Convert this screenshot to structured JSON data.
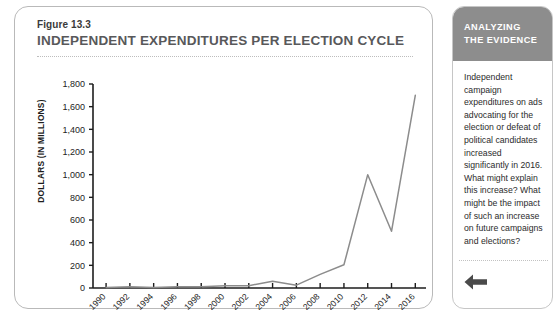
{
  "figure": {
    "number": "Figure 13.3",
    "title": "INDEPENDENT EXPENDITURES PER ELECTION CYCLE"
  },
  "sidebar": {
    "header_line1": "ANALYZING",
    "header_line2": "THE EVIDENCE",
    "body": "Independent campaign expenditures on ads advocating for the election or defeat of political candidates increased significantly in 2016. What might explain this increase? What might be the impact of such an increase on future campaigns and elections?",
    "back_arrow_icon": "arrow-left-icon"
  },
  "colors": {
    "panel_border": "#b9b9b9",
    "sidebar_header_bg": "#8d8d8d",
    "line": "#8c8c8c",
    "axis": "#1d1d1d",
    "title_text": "#58585a"
  },
  "chart_data": {
    "type": "line",
    "title": "INDEPENDENT EXPENDITURES PER ELECTION CYCLE",
    "xlabel": "",
    "ylabel": "DOLLARS (IN MILLIONS)",
    "x": [
      1990,
      1992,
      1994,
      1996,
      1998,
      2000,
      2002,
      2004,
      2006,
      2008,
      2010,
      2012,
      2014,
      2016
    ],
    "categories": [
      "1990",
      "1992",
      "1994",
      "1996",
      "1998",
      "2000",
      "2002",
      "2004",
      "2006",
      "2008",
      "2010",
      "2012",
      "2014",
      "2016"
    ],
    "values": [
      5,
      10,
      5,
      10,
      10,
      20,
      20,
      60,
      25,
      120,
      205,
      1000,
      500,
      1700
    ],
    "ylim": [
      0,
      1800
    ],
    "yticks": [
      0,
      200,
      400,
      600,
      800,
      1000,
      1200,
      1400,
      1600,
      1800
    ],
    "ytick_labels": [
      "0",
      "200",
      "400",
      "600",
      "800",
      "1,000",
      "1,200",
      "1,400",
      "1,600",
      "1,800"
    ],
    "grid": false,
    "legend": false,
    "series": [
      {
        "name": "Independent expenditures",
        "values": [
          5,
          10,
          5,
          10,
          10,
          20,
          20,
          60,
          25,
          120,
          205,
          1000,
          500,
          1700
        ]
      }
    ]
  }
}
